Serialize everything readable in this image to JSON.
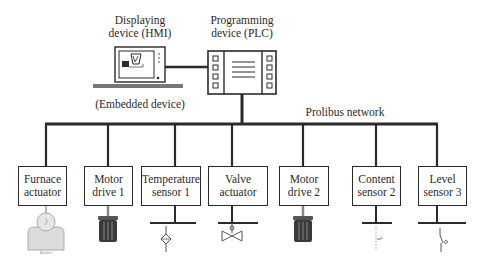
{
  "diagram": {
    "hmi": {
      "title_line1": "Displaying",
      "title_line2": "device (HMI)",
      "caption": "(Embedded device)"
    },
    "plc": {
      "title_line1": "Programming",
      "title_line2": "device (PLC)"
    },
    "network_label": "Prolibus network",
    "nodes": [
      {
        "line1": "Furnace",
        "line2": "actuator",
        "icon": "boiler-icon",
        "icon_caption": "Boiler"
      },
      {
        "line1": "Motor",
        "line2": "drive 1",
        "icon": "motor-icon"
      },
      {
        "line1": "Temperature",
        "line2": "sensor 1",
        "icon": "temperature-sensor-icon"
      },
      {
        "line1": "Valve",
        "line2": "actuator",
        "icon": "valve-icon"
      },
      {
        "line1": "Motor",
        "line2": "drive 2",
        "icon": "motor-icon"
      },
      {
        "line1": "Content",
        "line2": "sensor 2",
        "icon": "content-sensor-icon"
      },
      {
        "line1": "Level",
        "line2": "sensor 3",
        "icon": "level-switch-icon"
      }
    ]
  },
  "colors": {
    "line": "#2a2a2a",
    "icon_fill": "#d8d8d8",
    "motor_body": "#3a3a3a"
  }
}
